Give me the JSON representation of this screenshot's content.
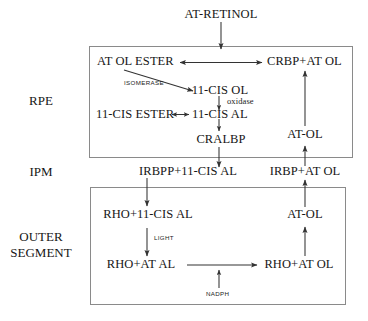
{
  "diagram": {
    "compartments": [
      {
        "id": "rpe",
        "label": "RPE"
      },
      {
        "id": "ipm",
        "label": "IPM"
      },
      {
        "id": "outer_segment",
        "label": "OUTER\nSEGMENT"
      },
      {
        "id": "outer_segment_line1",
        "label": "OUTER"
      },
      {
        "id": "outer_segment_line2",
        "label": "SEGMENT"
      }
    ],
    "nodes": [
      {
        "id": "at_retinol",
        "label": "AT-RETINOL"
      },
      {
        "id": "at_ol_ester",
        "label": "AT OL ESTER"
      },
      {
        "id": "crbp_at_ol",
        "label": "CRBP+AT OL"
      },
      {
        "id": "cis11_ol",
        "label": "11-CIS OL"
      },
      {
        "id": "cis11_ester",
        "label": "11-CIS ESTER"
      },
      {
        "id": "cis11_al",
        "label": "11-CIS AL"
      },
      {
        "id": "cralbp",
        "label": "CRALBP"
      },
      {
        "id": "at_ol_rpe",
        "label": "AT-OL"
      },
      {
        "id": "irbpp_cis11_al",
        "label": "IRBPP+11-CIS AL"
      },
      {
        "id": "irbp_at_ol",
        "label": "IRBP+AT OL"
      },
      {
        "id": "rho_cis11_al",
        "label": "RHO+11-CIS AL"
      },
      {
        "id": "at_ol_os",
        "label": "AT-OL"
      },
      {
        "id": "rho_at_al",
        "label": "RHO+AT AL"
      },
      {
        "id": "rho_at_ol",
        "label": "RHO+AT OL"
      }
    ],
    "enzyme_labels": [
      {
        "id": "isomerase",
        "label": "ISOMERASE"
      },
      {
        "id": "oxidase",
        "label": "oxidase"
      },
      {
        "id": "light",
        "label": "LIGHT"
      },
      {
        "id": "nadph",
        "label": "NADPH"
      }
    ],
    "colors": {
      "stroke": "#333333",
      "box_border": "#8a8a8a",
      "text": "#161616",
      "background": "#ffffff"
    }
  }
}
